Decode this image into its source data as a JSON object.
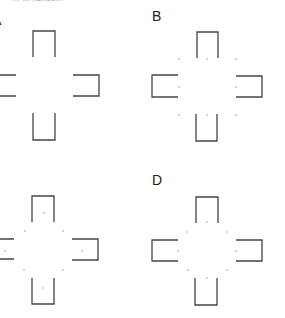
{
  "caption_fragment": "... in random",
  "panels": [
    {
      "id": "A",
      "label": "A"
    },
    {
      "id": "B",
      "label": "B"
    },
    {
      "id": "C",
      "label": "C"
    },
    {
      "id": "D",
      "label": "D"
    }
  ],
  "colors": {
    "stroke": "#444444",
    "dot": "#999999",
    "background": "#ffffff"
  }
}
